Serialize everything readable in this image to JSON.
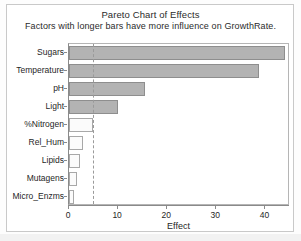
{
  "chart_data": {
    "type": "bar",
    "orientation": "horizontal",
    "title": "Pareto Chart of Effects",
    "subtitle": "Factors with longer bars have more influence on GrowthRate.",
    "xlabel": "Effect",
    "ylabel": "",
    "xlim": [
      0,
      45
    ],
    "xticks": [
      0,
      10,
      20,
      30,
      40
    ],
    "xticklabels": [
      "0",
      "10",
      "20",
      "30",
      "40"
    ],
    "grid": false,
    "legend": null,
    "categories": [
      "Sugars",
      "Temperature",
      "pH",
      "Light",
      "%Nitrogen",
      "Rel_Hum",
      "Lipids",
      "Mutagens",
      "Micro_Enzms"
    ],
    "values": [
      43.9,
      38.6,
      15.5,
      10.0,
      4.9,
      2.9,
      2.2,
      1.6,
      1.0
    ],
    "significant": [
      true,
      true,
      true,
      true,
      false,
      false,
      false,
      false,
      false
    ],
    "reference_line": {
      "value": 4.9,
      "style": "dashed",
      "color": "#9a9a9a"
    },
    "colors": {
      "significant_bar_fill": "#b3b3b3",
      "significant_bar_edge": "#8e8e8e",
      "nonsignificant_bar_fill": "#fbfbfb",
      "nonsignificant_bar_edge": "#a8a8a8",
      "axis": "#8a8a8a",
      "text": "#1f1f1f",
      "background": "#ffffff"
    }
  }
}
